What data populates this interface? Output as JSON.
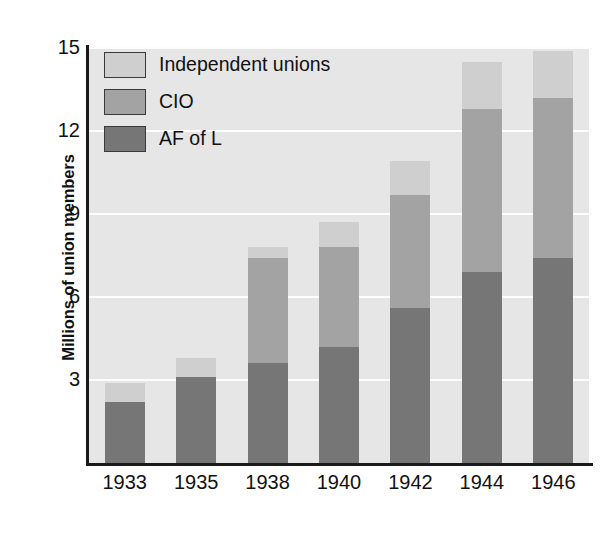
{
  "chart_data": {
    "type": "bar",
    "subtype": "stacked-vertical",
    "title": "",
    "xlabel": "",
    "ylabel": "Millions of union members",
    "categories": [
      "1933",
      "1935",
      "1938",
      "1940",
      "1942",
      "1944",
      "1946"
    ],
    "series": [
      {
        "name": "AF of L",
        "color": "#767676",
        "values": [
          2.2,
          3.1,
          3.6,
          4.2,
          5.6,
          6.9,
          7.4
        ]
      },
      {
        "name": "CIO",
        "color": "#a3a3a3",
        "values": [
          0.0,
          0.0,
          3.8,
          3.6,
          4.1,
          5.9,
          5.8
        ]
      },
      {
        "name": "Independent unions",
        "color": "#cfcfcf",
        "values": [
          0.7,
          0.7,
          0.4,
          0.9,
          1.2,
          1.7,
          1.7
        ]
      }
    ],
    "totals": [
      2.9,
      3.8,
      7.8,
      8.7,
      10.9,
      14.5,
      14.9
    ],
    "ylim": [
      0,
      15
    ],
    "yticks": [
      3,
      6,
      9,
      12,
      15
    ],
    "ytick_labels": [
      "3",
      "6",
      "9",
      "12",
      "15"
    ],
    "grid": true,
    "grid_axis": "y",
    "legend_position": "top-left",
    "plot_background": "#e6e6e6",
    "gridline_color": "#fdfdfd",
    "axis_color": "#1a1a1a"
  },
  "legend": {
    "items": [
      {
        "label": "Independent unions",
        "color": "#cfcfcf"
      },
      {
        "label": "CIO",
        "color": "#a3a3a3"
      },
      {
        "label": "AF of L",
        "color": "#767676"
      }
    ]
  },
  "axes": {
    "y_title": "Millions of union members",
    "y_ticks": [
      "15",
      "12",
      "9",
      "6",
      "3"
    ],
    "x_ticks": [
      "1933",
      "1935",
      "1938",
      "1940",
      "1942",
      "1944",
      "1946"
    ]
  }
}
